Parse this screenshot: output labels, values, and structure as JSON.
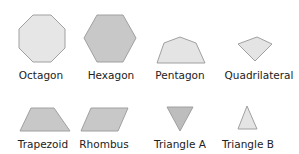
{
  "figure": {
    "background": "#ffffff",
    "stroke_color": "#a0a0a0",
    "label_color": "#222222",
    "shapes": [
      {
        "id": "octagon",
        "label": "Octagon",
        "sides": 8,
        "fill": "#e6e6e6",
        "points": "33,15 51,15 65,29 65,48 51,62 33,62 19,48 19,29",
        "label_x": 41,
        "label_y": 79
      },
      {
        "id": "hexagon",
        "label": "Hexagon",
        "sides": 6,
        "fill": "#c8c8c8",
        "points": "97,15 123,15 136,38 123,62 97,62 84,38",
        "label_x": 111,
        "label_y": 79
      },
      {
        "id": "pentagon",
        "label": "Pentagon",
        "sides": 5,
        "fill": "#e4e4e4",
        "points": "180,37 196,43 205,63 157,63 164,43",
        "label_x": 180,
        "label_y": 79
      },
      {
        "id": "quadrilateral",
        "label": "Quadrilateral",
        "sides": 4,
        "fill": "#e4e4e4",
        "points": "238,44 257,37 272,44 255,61",
        "label_x": 259,
        "label_y": 79
      },
      {
        "id": "trapezoid",
        "label": "Trapezoid",
        "sides": 4,
        "fill": "#c8c8c8",
        "points": "31,108 54,108 70,131 20,131",
        "label_x": 43,
        "label_y": 148
      },
      {
        "id": "rhombus",
        "label": "Rhombus",
        "sides": 4,
        "fill": "#c8c8c8",
        "points": "91,108 128,108 118,131 81,131",
        "label_x": 104,
        "label_y": 148
      },
      {
        "id": "triangle-a",
        "label": "Triangle A",
        "sides": 3,
        "fill": "#bdbdbd",
        "points": "167,107 193,107 180,131",
        "label_x": 180,
        "label_y": 148
      },
      {
        "id": "triangle-b",
        "label": "Triangle B",
        "sides": 3,
        "fill": "#e4e4e4",
        "points": "247,106 257,129 238,129",
        "label_x": 248,
        "label_y": 148
      }
    ]
  }
}
